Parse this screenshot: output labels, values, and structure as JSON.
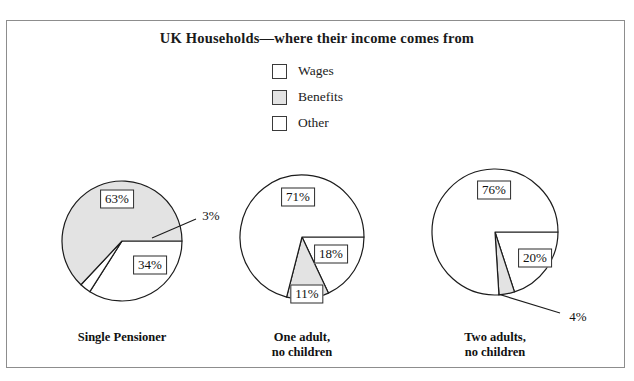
{
  "title": "UK Households—where their income comes from",
  "legend": {
    "items": [
      {
        "label": "Wages",
        "swatch": "white"
      },
      {
        "label": "Benefits",
        "swatch": "gray"
      },
      {
        "label": "Other",
        "swatch": "white"
      }
    ]
  },
  "colors": {
    "wages": "#ffffff",
    "benefits": "#e3e3e3",
    "other": "#ffffff",
    "outline": "#1c1c1c",
    "frame": "#8d8d8d",
    "background": "#ffffff"
  },
  "chart_data": {
    "type": "pie",
    "title": "UK Households—where their income comes from",
    "xlabel": "",
    "ylabel": "",
    "legend_position": "top-center",
    "legend": [
      "Wages",
      "Benefits",
      "Other"
    ],
    "units": "percent",
    "charts": [
      {
        "name": "Single Pensioner",
        "label_line1": "Single Pensioner",
        "label_line2": "",
        "slices": [
          {
            "category": "Wages",
            "value": 34,
            "label": "34%"
          },
          {
            "category": "Other",
            "value": 3,
            "label": "3%"
          },
          {
            "category": "Benefits",
            "value": 63,
            "label": "63%"
          }
        ]
      },
      {
        "name": "One adult, no children",
        "label_line1": "One adult,",
        "label_line2": "no children",
        "slices": [
          {
            "category": "Other",
            "value": 18,
            "label": "18%"
          },
          {
            "category": "Benefits",
            "value": 11,
            "label": "11%"
          },
          {
            "category": "Wages",
            "value": 71,
            "label": "71%"
          }
        ]
      },
      {
        "name": "Two adults, no children",
        "label_line1": "Two adults,",
        "label_line2": "no children",
        "slices": [
          {
            "category": "Other",
            "value": 20,
            "label": "20%"
          },
          {
            "category": "Benefits",
            "value": 4,
            "label": "4%"
          },
          {
            "category": "Wages",
            "value": 76,
            "label": "76%"
          }
        ]
      }
    ]
  }
}
